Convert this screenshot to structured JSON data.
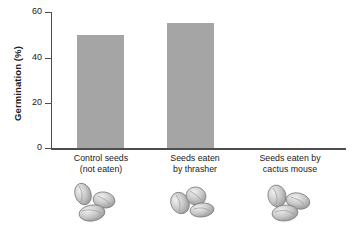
{
  "chart_data": {
    "type": "bar",
    "title": "",
    "subtitle": "",
    "xlabel": "",
    "ylabel": "Germination (%)",
    "ylim": [
      0,
      60
    ],
    "yticks": [
      0,
      20,
      40,
      60
    ],
    "ytick_labels": [
      "0",
      "20",
      "40",
      "60"
    ],
    "grid": false,
    "legend": null,
    "bar_color": "#a5a5a5",
    "axis_color": "#4d4d4d",
    "text_color": "#1a1a1a",
    "categories": [
      "Control seeds (not eaten)",
      "Seeds eaten by thrasher",
      "Seeds eaten by cactus mouse"
    ],
    "category_lines": [
      [
        "Control seeds",
        "(not eaten)"
      ],
      [
        "Seeds eaten",
        "by thrasher"
      ],
      [
        "Seeds eaten by",
        "cactus mouse"
      ]
    ],
    "values": [
      50,
      55,
      0
    ],
    "annotations": [
      "Seed illustration below 'Control seeds (not eaten)'",
      "Seed illustration below 'Seeds eaten by thrasher'",
      "Seed illustration below 'Seeds eaten by cactus mouse'"
    ]
  },
  "axis": {
    "y_title": "Germination (%)",
    "ticks": [
      {
        "label": "60",
        "value": 60
      },
      {
        "label": "40",
        "value": 40
      },
      {
        "label": "20",
        "value": 20
      },
      {
        "label": "0",
        "value": 0
      }
    ]
  },
  "icons": {
    "seed_cluster": "seed-cluster-icon"
  }
}
